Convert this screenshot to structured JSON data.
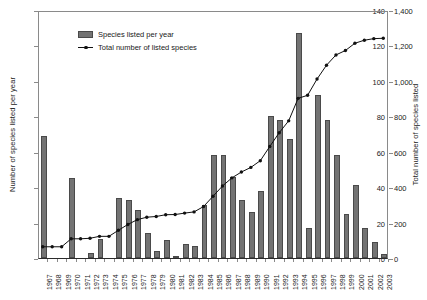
{
  "chart_data": {
    "type": "bar",
    "title": "",
    "subtitle": "",
    "xlabel": "",
    "ylabel": "Number of species listed per year",
    "y2label": "Total number of species listed",
    "ylim": [
      0,
      140
    ],
    "y2lim": [
      0,
      1400
    ],
    "grid": false,
    "legend_position": "top-left-inside",
    "categories": [
      "1967",
      "1968",
      "1969",
      "1970",
      "1971",
      "1972",
      "1973",
      "1974",
      "1975",
      "1976",
      "1977",
      "1978",
      "1979",
      "1980",
      "1981",
      "1982",
      "1983",
      "1984",
      "1985",
      "1986",
      "1987",
      "1988",
      "1989",
      "1990",
      "1991",
      "1992",
      "1993",
      "1994",
      "1995",
      "1996",
      "1997",
      "1998",
      "1999",
      "2000",
      "2001",
      "2002",
      "2003"
    ],
    "series": [
      {
        "name": "Species listed per year",
        "axis": "left",
        "type": "bar",
        "color": "#737373",
        "values": [
          69,
          0,
          0,
          45,
          0,
          3,
          11,
          0,
          34,
          33,
          27,
          14,
          4,
          10,
          1,
          8,
          7,
          30,
          58,
          58,
          46,
          33,
          26,
          38,
          80,
          78,
          67,
          127,
          17,
          92,
          78,
          58,
          25,
          41,
          17,
          9,
          2
        ]
      },
      {
        "name": "Total number of listed species",
        "axis": "right",
        "type": "line",
        "color": "#111111",
        "marker": "diamond",
        "values": [
          69,
          69,
          69,
          114,
          114,
          117,
          128,
          128,
          162,
          195,
          222,
          236,
          240,
          250,
          251,
          259,
          266,
          296,
          354,
          412,
          458,
          491,
          517,
          555,
          635,
          713,
          780,
          907,
          924,
          1016,
          1094,
          1152,
          1177,
          1218,
          1235,
          1244,
          1246
        ]
      }
    ],
    "y_ticks_left": [
      "0",
      "20",
      "40",
      "60",
      "80",
      "100",
      "120",
      "140"
    ],
    "y_ticks_right": [
      "0",
      "200",
      "400",
      "600",
      "800",
      "1,000",
      "1,200",
      "1,400"
    ]
  },
  "legend": {
    "items": [
      {
        "label": "Species listed per year",
        "marker": "bar-swatch"
      },
      {
        "label": "Total number of listed species",
        "marker": "line-marker"
      }
    ]
  }
}
